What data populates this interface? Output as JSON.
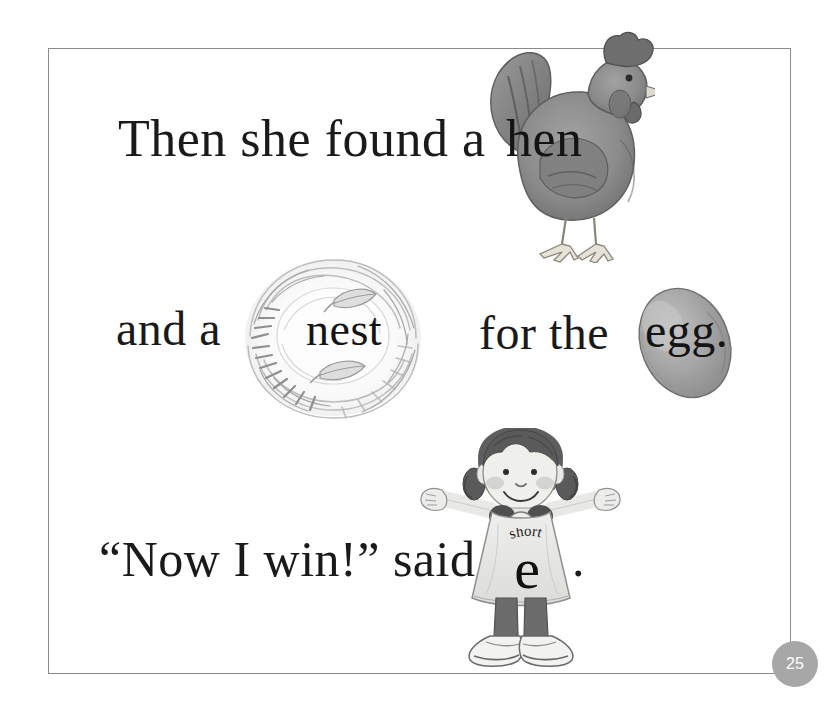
{
  "page": {
    "number": "25",
    "background_color": "#ffffff",
    "frame_color": "#8a8a8a",
    "text_color": "#1a1a1a",
    "badge_color": "#a7a7a7"
  },
  "lines": {
    "line1_before": "Then she found a ",
    "line2_before": "and a ",
    "line2_middle": "  for the ",
    "line3_before": "“Now I win!” said ",
    "final_period": "."
  },
  "art_words": {
    "hen": "hen",
    "nest": "nest",
    "egg": "egg."
  },
  "dress": {
    "short_label": "short",
    "letter": "e",
    "short_letters": [
      "s",
      "h",
      "o",
      "r",
      "t"
    ]
  },
  "illustrations": {
    "hen": {
      "name": "hen",
      "body_color": "#8b8b8b",
      "comb_color": "#6e6e6e",
      "leg_color": "#d8d4cc"
    },
    "nest": {
      "name": "nest",
      "twig_color": "#b9b9b9",
      "leaf_color": "#c9c9c9"
    },
    "egg": {
      "name": "egg",
      "shell_color": "#9d9d9d",
      "highlight_color": "#c0c0c0"
    },
    "girl": {
      "name": "girl-character",
      "hair_color": "#5a5a5a",
      "skin_color": "#ededea",
      "dress_color": "#e2e2e0",
      "pants_color": "#6e6e6e",
      "shoe_color": "#f0f0ee",
      "cheek_color": "#c8c8c8",
      "medal_color": "#e8e8e4"
    }
  }
}
